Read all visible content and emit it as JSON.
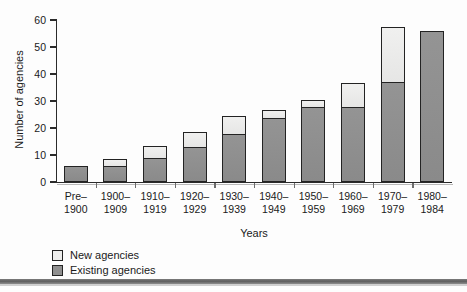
{
  "figure": {
    "background_color": "#fdfdfd",
    "axis_color": "#2b2b2b",
    "page_rule_color": "#5e5e5e"
  },
  "chart_data": {
    "type": "bar",
    "subtype": "stacked-bar",
    "title": "",
    "xlabel": "Years",
    "ylabel": "Number of agencies",
    "ylim": [
      0,
      60
    ],
    "yticks": [
      0,
      10,
      20,
      30,
      40,
      50,
      60
    ],
    "grid": false,
    "legend_position": "below-left",
    "categories": [
      "Pre–1900",
      "1900–1909",
      "1910–1919",
      "1920–1929",
      "1930–1939",
      "1940–1949",
      "1950–1959",
      "1960–1969",
      "1970–1979",
      "1980–1984"
    ],
    "category_lines": [
      [
        "Pre–",
        "1900"
      ],
      [
        "1900–",
        "1909"
      ],
      [
        "1910–",
        "1919"
      ],
      [
        "1920–",
        "1929"
      ],
      [
        "1930–",
        "1939"
      ],
      [
        "1940–",
        "1949"
      ],
      [
        "1950–",
        "1959"
      ],
      [
        "1960–",
        "1969"
      ],
      [
        "1970–",
        "1979"
      ],
      [
        "1980–",
        "1984"
      ]
    ],
    "series": [
      {
        "name": "Existing agencies",
        "color": "#8f8f8f",
        "values": [
          6,
          6,
          9,
          13,
          18,
          24,
          28,
          28,
          37,
          56
        ]
      },
      {
        "name": "New agencies",
        "color": "#ededec",
        "values": [
          0,
          3,
          5,
          6,
          7,
          3,
          3,
          9,
          21,
          0
        ]
      }
    ],
    "totals": [
      6,
      9,
      14,
      19,
      25,
      27,
      31,
      37,
      58,
      56
    ]
  },
  "legend": {
    "items": [
      {
        "label": "New agencies",
        "swatch": "new"
      },
      {
        "label": "Existing agencies",
        "swatch": "existing"
      }
    ]
  }
}
